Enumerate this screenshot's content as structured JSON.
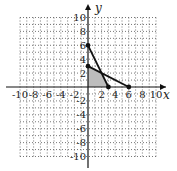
{
  "chart_data": {
    "type": "line",
    "title": "",
    "xlabel": "x",
    "ylabel": "y",
    "xlim": [
      -10,
      10
    ],
    "ylim": [
      -10,
      10
    ],
    "grid": true,
    "grid_style": "dotted",
    "x_ticks": [
      -10,
      -8,
      -6,
      -4,
      -2,
      2,
      4,
      6,
      8,
      10
    ],
    "y_ticks": [
      -10,
      -8,
      -6,
      -4,
      -2,
      2,
      4,
      6,
      8,
      10
    ],
    "x_tick_labels": [
      "-10",
      "-8",
      "-6",
      "-4",
      "-2",
      "2",
      "4",
      "6",
      "8",
      "10"
    ],
    "y_tick_labels": [
      "-10",
      "-8",
      "-6",
      "-4",
      "-2",
      "2",
      "4",
      "6",
      "8",
      "10"
    ],
    "series": [
      {
        "name": "line-1",
        "points": [
          [
            0,
            6
          ],
          [
            3,
            0
          ]
        ],
        "equation": "2x + y = 6"
      },
      {
        "name": "line-2",
        "points": [
          [
            0,
            3
          ],
          [
            6,
            0
          ]
        ],
        "equation": "x + 2y = 6"
      }
    ],
    "shaded_region": {
      "vertices": [
        [
          0,
          0
        ],
        [
          0,
          3
        ],
        [
          2,
          2
        ],
        [
          3,
          0
        ]
      ],
      "color": "#bdbdbd"
    },
    "marked_points": [
      [
        0,
        6
      ],
      [
        0,
        3
      ],
      [
        3,
        0
      ],
      [
        6,
        0
      ]
    ]
  },
  "axes": {
    "x_label": "x",
    "y_label": "y"
  },
  "colors": {
    "line": "#111111",
    "grid": "#555555",
    "shade": "#bdbdbd"
  }
}
